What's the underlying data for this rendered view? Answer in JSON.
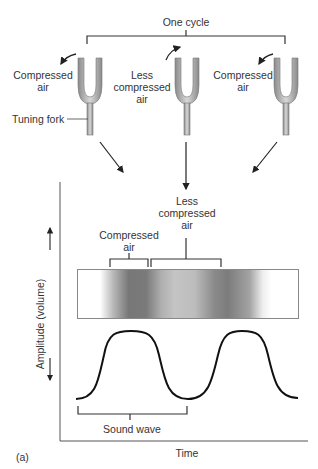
{
  "diagram": {
    "top": {
      "cycle_label": "One cycle",
      "forks": [
        {
          "label_line1": "Compressed",
          "label_line2": "air",
          "label_line3": ""
        },
        {
          "label_line1": "Less",
          "label_line2": "compressed",
          "label_line3": "air"
        },
        {
          "label_line1": "Compressed",
          "label_line2": "air",
          "label_line3": ""
        }
      ],
      "fork_callout": "Tuning fork"
    },
    "graph": {
      "compressed_label_line1": "Compressed",
      "compressed_label_line2": "air",
      "less_label_line1": "Less",
      "less_label_line2": "compressed",
      "less_label_line3": "air",
      "y_axis_label": "Amplitude (volume)",
      "x_axis_label": "Time",
      "sound_wave_label": "Sound wave"
    },
    "panel_label": "(a)"
  }
}
